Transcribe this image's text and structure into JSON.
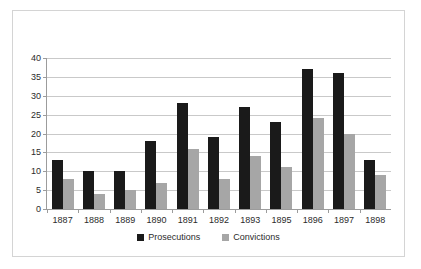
{
  "chart_data": {
    "type": "bar",
    "title": "",
    "subtitle": "",
    "xlabel": "",
    "ylabel": "",
    "categories": [
      "1887",
      "1888",
      "1889",
      "1890",
      "1891",
      "1892",
      "1893",
      "1895",
      "1896",
      "1897",
      "1898"
    ],
    "series": [
      {
        "name": "Prosecutions",
        "color": "#1a1a1a",
        "values": [
          13,
          10,
          10,
          18,
          28,
          19,
          27,
          23,
          37,
          36,
          13
        ]
      },
      {
        "name": "Convictions",
        "color": "#a6a6a6",
        "values": [
          8,
          4,
          5,
          7,
          16,
          8,
          14,
          11,
          24,
          20,
          9
        ]
      }
    ],
    "ylim": [
      0,
      40
    ],
    "yticks": [
      0,
      5,
      10,
      15,
      20,
      25,
      30,
      35,
      40
    ],
    "ytick_labels": [
      "0",
      "5",
      "10",
      "15",
      "20",
      "25",
      "30",
      "35",
      "40"
    ],
    "grid": true,
    "grid_axis": "y",
    "legend_position": "bottom",
    "legend": [
      "Prosecutions",
      "Convictions"
    ],
    "annotations": []
  },
  "colors": {
    "prosecutions": "#1a1a1a",
    "convictions": "#a6a6a6",
    "gridline": "#c9c9c9",
    "axis": "#9c9c9c",
    "frame_border": "#d4d4d4",
    "text": "#2b2b2b",
    "background": "#ffffff"
  }
}
